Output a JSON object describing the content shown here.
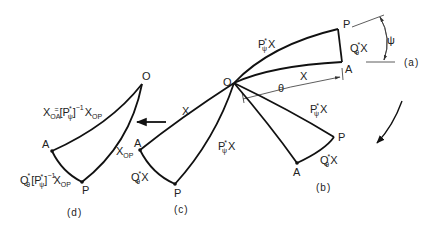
{
  "figure": {
    "colors": {
      "ink": "#111111",
      "background": "#ffffff"
    },
    "panels": {
      "a": {
        "caption": "(a)",
        "origin": "O",
        "point_p": "P",
        "point_a": "A",
        "edge_op": "P",
        "edge_op_star": "*",
        "edge_op_sub": "ψ",
        "edge_op_x": "X",
        "edge_oa": "X",
        "edge_ap": "Q",
        "edge_ap_star": "*",
        "edge_ap_sub": "θ",
        "edge_ap_x": "X",
        "angle_theta": "θ",
        "angle_psi": "ψ"
      },
      "b": {
        "caption": "(b)",
        "point_p": "P",
        "point_a": "A",
        "edge_op": "P",
        "edge_op_star": "*",
        "edge_op_sub": "ψ",
        "edge_op_x": "X",
        "edge_ap": "Q",
        "edge_ap_star": "*",
        "edge_ap_sub": "θ",
        "edge_ap_x": "X"
      },
      "c": {
        "caption": "(c)",
        "point_p": "P",
        "point_a": "A",
        "edge_oa": "X",
        "edge_op": "P",
        "edge_op_star": "*",
        "edge_op_sub": "ψ",
        "edge_op_x": "X",
        "edge_ap": "Q",
        "edge_ap_star": "*",
        "edge_ap_sub": "θ",
        "edge_ap_x": "X"
      },
      "d": {
        "caption": "(d)",
        "origin": "O",
        "point_p": "P",
        "point_a": "A",
        "edge_op": "X",
        "edge_op_sub": "OP",
        "edge_oa_x": "X",
        "edge_oa_sub": "OA",
        "edge_oa_eq": "=",
        "edge_oa_bracket": "[P",
        "edge_oa_star": "*",
        "edge_oa_psi": "ψ",
        "edge_oa_close": "]",
        "edge_oa_exp": "−1",
        "edge_oa_xop": "X",
        "edge_oa_xop_sub": "OP",
        "edge_ap_q": "Q",
        "edge_ap_q_star": "*",
        "edge_ap_q_sub": "θ",
        "edge_ap_bracket": "[P",
        "edge_ap_star": "*",
        "edge_ap_psi": "ψ",
        "edge_ap_close": "]",
        "edge_ap_exp": "−1",
        "edge_ap_x": "X",
        "edge_ap_x_sub": "OP"
      }
    }
  }
}
